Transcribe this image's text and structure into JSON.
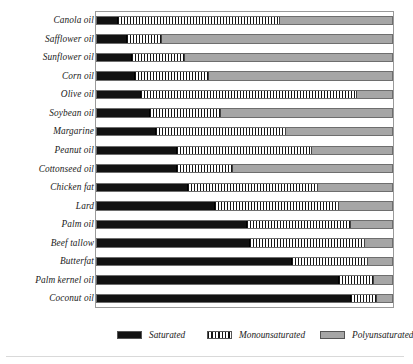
{
  "chart_data": {
    "type": "bar",
    "title": "",
    "subtitle": "",
    "xlabel": "",
    "ylabel": "",
    "orientation": "horizontal",
    "stacked": true,
    "xlim": [
      0,
      100
    ],
    "xunit": "percent of total fat",
    "grid": false,
    "axis_ticks_visible": false,
    "legend_position": "bottom",
    "categories": [
      "Canola oil",
      "Safflower oil",
      "Sunflower oil",
      "Corn oil",
      "Olive oil",
      "Soybean oil",
      "Margarine",
      "Peanut oil",
      "Cottonseed oil",
      "Chicken fat",
      "Lard",
      "Palm oil",
      "Beef tallow",
      "Butterfat",
      "Palm kernel oil",
      "Coconut oil"
    ],
    "series": [
      {
        "name": "Saturated",
        "color": "#121212",
        "pattern": "solid",
        "values": [
          7,
          10,
          12,
          13,
          15,
          18,
          20,
          27,
          27,
          31,
          40,
          51,
          52,
          66,
          82,
          86
        ]
      },
      {
        "name": "Monounsaturated",
        "color": "#141414",
        "pattern": "vertical-stripes",
        "values": [
          55,
          12,
          18,
          25,
          73,
          24,
          44,
          46,
          19,
          44,
          42,
          35,
          39,
          26,
          12,
          9
        ]
      },
      {
        "name": "Polyunsaturated",
        "color": "#a6a6a6",
        "pattern": "solid-gray",
        "values": [
          38,
          78,
          70,
          62,
          12,
          58,
          36,
          27,
          54,
          25,
          18,
          14,
          9,
          8,
          6,
          5
        ]
      }
    ]
  },
  "legend": {
    "items": [
      {
        "label": "Saturated",
        "swatch": "sat"
      },
      {
        "label": "Monounsaturated",
        "swatch": "mono"
      },
      {
        "label": "Polyunsaturated",
        "swatch": "poly"
      }
    ]
  },
  "artifacts": {
    "top_marks": [
      "",
      "",
      ""
    ]
  }
}
